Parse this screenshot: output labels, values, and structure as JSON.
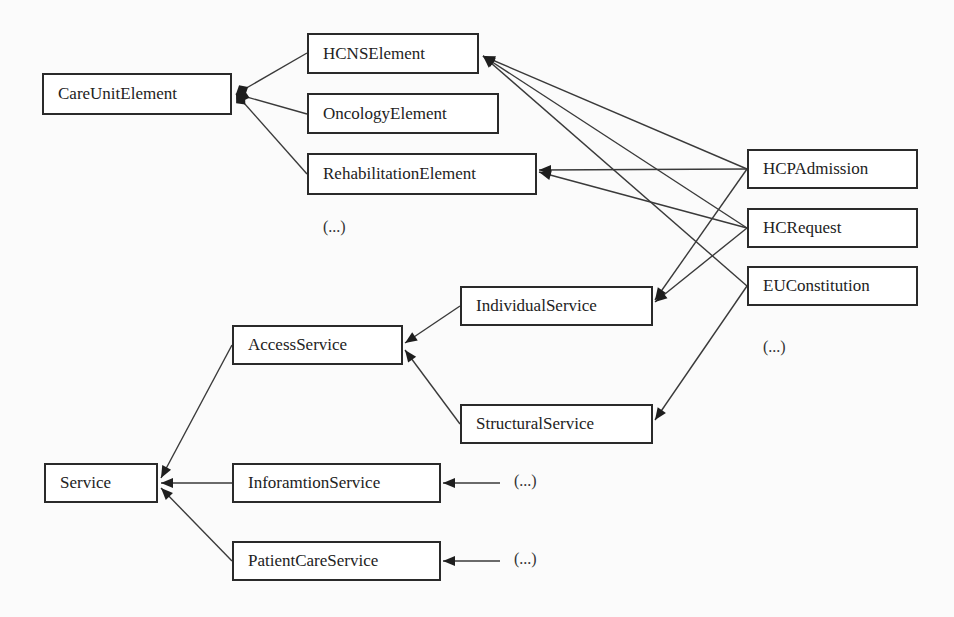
{
  "diagram": {
    "nodes": [
      {
        "id": "CareUnitElement",
        "label": "CareUnitElement",
        "x": 42,
        "y": 73,
        "w": 190,
        "h": 42
      },
      {
        "id": "HCNSElement",
        "label": "HCNSElement",
        "x": 307,
        "y": 33,
        "w": 172,
        "h": 41
      },
      {
        "id": "OncologyElement",
        "label": "OncologyElement",
        "x": 307,
        "y": 93,
        "w": 192,
        "h": 41
      },
      {
        "id": "RehabilitationElement",
        "label": "RehabilitationElement",
        "x": 307,
        "y": 153,
        "w": 230,
        "h": 42
      },
      {
        "id": "HCPAdmission",
        "label": "HCPAdmission",
        "x": 747,
        "y": 149,
        "w": 171,
        "h": 40
      },
      {
        "id": "HCRequest",
        "label": "HCRequest",
        "x": 747,
        "y": 208,
        "w": 171,
        "h": 40
      },
      {
        "id": "EUConstitution",
        "label": "EUConstitution",
        "x": 747,
        "y": 266,
        "w": 171,
        "h": 40
      },
      {
        "id": "IndividualService",
        "label": "IndividualService",
        "x": 460,
        "y": 286,
        "w": 193,
        "h": 40
      },
      {
        "id": "AccessService",
        "label": "AccessService",
        "x": 232,
        "y": 325,
        "w": 171,
        "h": 40
      },
      {
        "id": "StructuralService",
        "label": "StructuralService",
        "x": 460,
        "y": 404,
        "w": 193,
        "h": 40
      },
      {
        "id": "Service",
        "label": "Service",
        "x": 44,
        "y": 463,
        "w": 114,
        "h": 40
      },
      {
        "id": "InforamtionService",
        "label": "InforamtionService",
        "x": 232,
        "y": 463,
        "w": 209,
        "h": 40
      },
      {
        "id": "PatientCareService",
        "label": "PatientCareService",
        "x": 232,
        "y": 541,
        "w": 209,
        "h": 40
      }
    ],
    "notes": [
      {
        "id": "ellipsis-elements",
        "label": "(...)",
        "x": 323,
        "y": 218
      },
      {
        "id": "ellipsis-right",
        "label": "(...)",
        "x": 763,
        "y": 338
      },
      {
        "id": "ellipsis-info",
        "label": "(...)",
        "x": 514,
        "y": 472
      },
      {
        "id": "ellipsis-patient",
        "label": "(...)",
        "x": 514,
        "y": 550
      }
    ],
    "edges": [
      {
        "from": "HCNSElement",
        "to": "CareUnitElement",
        "type": "composition",
        "x1": 307,
        "y1": 53,
        "x2": 236,
        "y2": 94
      },
      {
        "from": "OncologyElement",
        "to": "CareUnitElement",
        "type": "composition",
        "x1": 307,
        "y1": 114,
        "x2": 236,
        "y2": 94
      },
      {
        "from": "RehabilitationElement",
        "to": "CareUnitElement",
        "type": "composition",
        "x1": 307,
        "y1": 174,
        "x2": 236,
        "y2": 94
      },
      {
        "from": "HCPAdmission",
        "to": "HCNSElement",
        "type": "arrow",
        "x1": 747,
        "y1": 169,
        "x2": 483,
        "y2": 56
      },
      {
        "from": "HCRequest",
        "to": "HCNSElement",
        "type": "arrow",
        "x1": 747,
        "y1": 228,
        "x2": 483,
        "y2": 56
      },
      {
        "from": "EUConstitution",
        "to": "HCNSElement",
        "type": "arrow",
        "x1": 747,
        "y1": 286,
        "x2": 483,
        "y2": 56
      },
      {
        "from": "HCPAdmission",
        "to": "RehabilitationElement",
        "type": "arrow",
        "x1": 747,
        "y1": 169,
        "x2": 539,
        "y2": 170
      },
      {
        "from": "HCRequest",
        "to": "RehabilitationElement",
        "type": "arrow",
        "x1": 747,
        "y1": 228,
        "x2": 539,
        "y2": 172
      },
      {
        "from": "HCPAdmission",
        "to": "IndividualService",
        "type": "arrow",
        "x1": 747,
        "y1": 169,
        "x2": 655,
        "y2": 300
      },
      {
        "from": "HCRequest",
        "to": "IndividualService",
        "type": "arrow",
        "x1": 747,
        "y1": 228,
        "x2": 655,
        "y2": 302
      },
      {
        "from": "EUConstitution",
        "to": "StructuralService",
        "type": "arrow",
        "x1": 747,
        "y1": 286,
        "x2": 655,
        "y2": 420
      },
      {
        "from": "IndividualService",
        "to": "AccessService",
        "type": "arrow",
        "x1": 460,
        "y1": 306,
        "x2": 405,
        "y2": 343
      },
      {
        "from": "StructuralService",
        "to": "AccessService",
        "type": "arrow",
        "x1": 460,
        "y1": 424,
        "x2": 405,
        "y2": 350
      },
      {
        "from": "AccessService",
        "to": "Service",
        "type": "arrow",
        "x1": 232,
        "y1": 345,
        "x2": 161,
        "y2": 478
      },
      {
        "from": "InforamtionService",
        "to": "Service",
        "type": "arrow",
        "x1": 232,
        "y1": 483,
        "x2": 161,
        "y2": 483
      },
      {
        "from": "PatientCareService",
        "to": "Service",
        "type": "arrow",
        "x1": 232,
        "y1": 561,
        "x2": 161,
        "y2": 488
      },
      {
        "from": "ellipsis-info",
        "to": "InforamtionService",
        "type": "arrow",
        "x1": 500,
        "y1": 483,
        "x2": 443,
        "y2": 483
      },
      {
        "from": "ellipsis-patient",
        "to": "PatientCareService",
        "type": "arrow",
        "x1": 500,
        "y1": 561,
        "x2": 443,
        "y2": 561
      }
    ],
    "colors": {
      "line": "#3a3a3a",
      "border": "#2a2a2a",
      "background": "#fbfbfb",
      "box": "#ffffff"
    }
  }
}
